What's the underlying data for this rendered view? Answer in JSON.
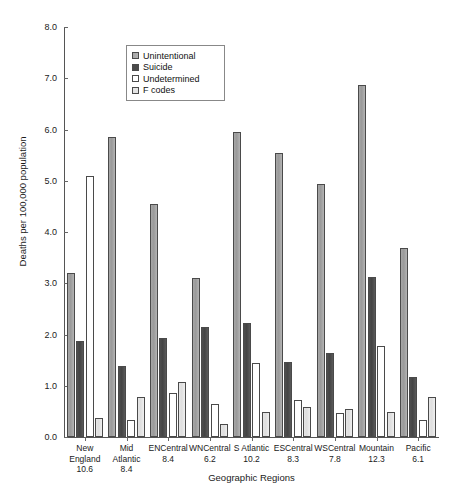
{
  "chart_data": {
    "type": "bar",
    "title": "",
    "xlabel": "Geographic Regions",
    "ylabel": "Deaths per 100,000 population",
    "ylim": [
      0.0,
      8.0
    ],
    "ytick_labels": [
      "8.0",
      "7.0",
      "6.0",
      "5.0",
      "4.0",
      "3.0",
      "2.0",
      "1.0",
      "0.0"
    ],
    "ytick_values": [
      8.0,
      7.0,
      6.0,
      5.0,
      4.0,
      3.0,
      2.0,
      1.0,
      0.0
    ],
    "grid": false,
    "legend_position": "upper-left-inside",
    "categories": [
      "New England 10.6",
      "Mid Atlantic 8.4",
      "ENCentral 8.4",
      "WNCentral 6.2",
      "S Atlantic 10.2",
      "ESCentral 8.3",
      "WSCentral 7.8",
      "Mountain 12.3",
      "Pacific 6.1"
    ],
    "category_lines": [
      [
        "New",
        "England",
        "10.6"
      ],
      [
        "Mid",
        "Atlantic 8.4"
      ],
      [
        "ENCentral",
        "8.4"
      ],
      [
        "WNCentral",
        "6.2"
      ],
      [
        "S Atlantic",
        "10.2"
      ],
      [
        "ESCentral",
        "8.3"
      ],
      [
        "WSCentral",
        "7.8"
      ],
      [
        "Mountain",
        "12.3"
      ],
      [
        "Pacific",
        "6.1"
      ]
    ],
    "series": [
      {
        "name": "Unintentional",
        "color": "#a7a7a7",
        "values": [
          3.2,
          5.85,
          4.55,
          3.1,
          5.95,
          5.55,
          4.93,
          6.87,
          3.68
        ]
      },
      {
        "name": "Suicide",
        "color": "#4a4a4a",
        "values": [
          1.87,
          1.38,
          1.94,
          2.15,
          2.23,
          1.46,
          1.64,
          3.13,
          1.17
        ]
      },
      {
        "name": "Undetermined",
        "color": "#ffffff",
        "values": [
          5.1,
          0.33,
          0.85,
          0.65,
          1.45,
          0.72,
          0.47,
          1.78,
          0.33
        ]
      },
      {
        "name": "F codes",
        "color": "#e4e4e4",
        "values": [
          0.38,
          0.78,
          1.07,
          0.26,
          0.48,
          0.58,
          0.55,
          0.48,
          0.78
        ]
      }
    ]
  },
  "legend": {
    "items": [
      {
        "label": "Unintentional"
      },
      {
        "label": "Suicide"
      },
      {
        "label": "Undetermined"
      },
      {
        "label": "F codes"
      }
    ]
  }
}
